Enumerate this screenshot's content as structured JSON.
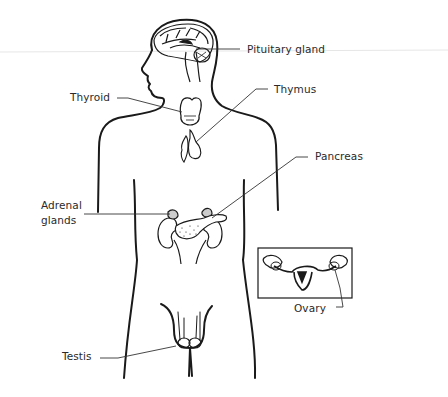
{
  "diagram": {
    "stroke_color": "#1a1a1a",
    "leader_color": "#333333",
    "background": "#ffffff",
    "labels": [
      {
        "id": "pituitary",
        "text": "Pituitary gland",
        "x": 247,
        "y": 43
      },
      {
        "id": "thymus",
        "text": "Thymus",
        "x": 274,
        "y": 83
      },
      {
        "id": "thyroid",
        "text": "Thyroid",
        "x": 70,
        "y": 91
      },
      {
        "id": "pancreas",
        "text": "Pancreas",
        "x": 315,
        "y": 150
      },
      {
        "id": "adrenal",
        "text": "Adrenal\nglands",
        "x": 41,
        "y": 198
      },
      {
        "id": "ovary",
        "text": "Ovary",
        "x": 294,
        "y": 302
      },
      {
        "id": "testis",
        "text": "Testis",
        "x": 62,
        "y": 350
      }
    ],
    "inset": {
      "name": "female-reproductive-inset",
      "x": 258,
      "y": 248,
      "width": 94,
      "height": 50
    }
  }
}
